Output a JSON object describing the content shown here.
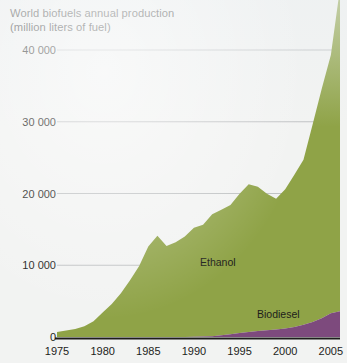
{
  "figure": {
    "title_line1": "World biofuels annual production",
    "title_line2": "(million liters of fuel)",
    "background_color": "#f2f3f2"
  },
  "chart_data": {
    "type": "area",
    "stacked": true,
    "title": "World biofuels annual production (million liters of fuel)",
    "xlabel": "",
    "ylabel": "million liters of fuel",
    "xlim": [
      1975,
      2006
    ],
    "ylim": [
      0,
      40000
    ],
    "xticks": [
      1975,
      1980,
      1985,
      1990,
      1995,
      2000,
      2005
    ],
    "xtick_labels": [
      "1975",
      "1980",
      "1985",
      "1990",
      "1995",
      "2000",
      "2005"
    ],
    "yticks": [
      0,
      10000,
      20000,
      30000,
      40000
    ],
    "ytick_labels": [
      "0",
      "10 000",
      "20 000",
      "30 000",
      "40 000"
    ],
    "grid": "horizontal",
    "legend_position": "inline-annotations",
    "colors": {
      "ethanol": "#8fa347",
      "biodiesel": "#7d4a7d",
      "gridline": "#b9bcbd",
      "axis": "#1d1d1b",
      "text": "#1d1d1b"
    },
    "x": [
      1975,
      1976,
      1977,
      1978,
      1979,
      1980,
      1981,
      1982,
      1983,
      1984,
      1985,
      1986,
      1987,
      1988,
      1989,
      1990,
      1991,
      1992,
      1993,
      1994,
      1995,
      1996,
      1997,
      1998,
      1999,
      2000,
      2001,
      2002,
      2003,
      2004,
      2005,
      2006
    ],
    "series": [
      {
        "name": "Ethanol",
        "label": "Ethanol",
        "color": "#8fa347",
        "values": [
          700,
          900,
          1100,
          1500,
          2200,
          3400,
          4600,
          6100,
          7900,
          9900,
          12600,
          14100,
          12700,
          13200,
          14000,
          15200,
          15600,
          17000,
          17500,
          18000,
          19400,
          20600,
          20100,
          19000,
          18200,
          19400,
          21200,
          23000,
          27500,
          32000,
          36000,
          45000
        ]
      },
      {
        "name": "Biodiesel",
        "label": "Biodiesel",
        "color": "#7d4a7d",
        "values": [
          0,
          0,
          0,
          0,
          0,
          0,
          0,
          0,
          0,
          0,
          0,
          0,
          0,
          0,
          0,
          20,
          60,
          120,
          230,
          400,
          560,
          700,
          830,
          950,
          1060,
          1200,
          1400,
          1700,
          2100,
          2600,
          3300,
          3600
        ]
      }
    ],
    "annotations": [
      {
        "text": "Ethanol",
        "x": 1994,
        "y": 11000
      },
      {
        "text": "Biodiesel",
        "x": 2000,
        "y": 2400
      }
    ]
  }
}
